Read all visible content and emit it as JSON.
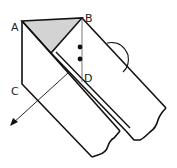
{
  "diagram": {
    "type": "folded-paper-strip",
    "labels": {
      "A": "A",
      "B": "B",
      "C": "C",
      "D": "D"
    },
    "colors": {
      "stroke": "#111111",
      "shaded_triangle": "#d3d3d3",
      "background": "#ffffff"
    },
    "marks": {
      "angle_markers": 2,
      "angle_arc": "arc"
    }
  }
}
